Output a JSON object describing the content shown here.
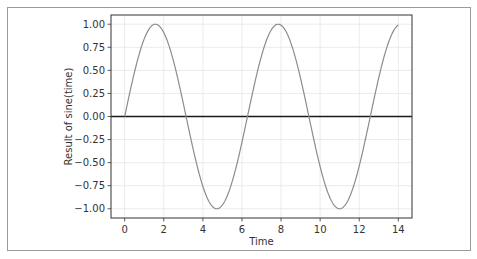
{
  "chart_data": {
    "type": "line",
    "title": "",
    "xlabel": "Time",
    "ylabel": "Result of sine(time)",
    "xlim": [
      -0.7,
      14.7
    ],
    "ylim": [
      -1.1,
      1.1
    ],
    "xticks": [
      0,
      2,
      4,
      6,
      8,
      10,
      12,
      14
    ],
    "xtick_labels": [
      "0",
      "2",
      "4",
      "6",
      "8",
      "10",
      "12",
      "14"
    ],
    "yticks": [
      1.0,
      0.75,
      0.5,
      0.25,
      0.0,
      -0.25,
      -0.5,
      -0.75,
      -1.0
    ],
    "ytick_labels": [
      "1.00",
      "0.75",
      "0.50",
      "0.25",
      "0.00",
      "−0.25",
      "−0.50",
      "−0.75",
      "−1.00"
    ],
    "grid": true,
    "legend": null,
    "series": [
      {
        "name": "sine(time)",
        "function": "sin(x)",
        "x_range": [
          0,
          14
        ],
        "color": "#8c8c8c",
        "x": [
          0,
          0.5,
          1,
          1.5708,
          2,
          2.5,
          3,
          3.1416,
          3.5,
          4,
          4.5,
          4.7124,
          5,
          5.5,
          6,
          6.2832,
          6.5,
          7,
          7.5,
          7.854,
          8,
          8.5,
          9,
          9.4248,
          9.5,
          10,
          10.5,
          10.9956,
          11,
          11.5,
          12,
          12.5664,
          13,
          13.5,
          14
        ],
        "y": [
          0,
          0.479,
          0.841,
          1.0,
          0.909,
          0.598,
          0.141,
          0,
          -0.351,
          -0.757,
          -0.978,
          -1.0,
          -0.959,
          -0.706,
          -0.279,
          0,
          0.215,
          0.657,
          0.938,
          1.0,
          0.989,
          0.798,
          0.412,
          0,
          -0.075,
          -0.544,
          -0.88,
          -1.0,
          -1.0,
          -0.875,
          -0.537,
          0,
          0.42,
          0.804,
          0.991
        ]
      }
    ],
    "reference_lines": [
      {
        "orientation": "horizontal",
        "y": 0,
        "color": "#1a1a1a",
        "width": 1.6
      }
    ],
    "colors": {
      "grid": "#e6e6e6",
      "axes": "#333333",
      "curve": "#8c8c8c",
      "zero_line": "#1a1a1a"
    }
  }
}
